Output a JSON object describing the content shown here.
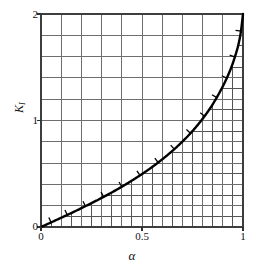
{
  "chart_data": {
    "type": "line",
    "title": "",
    "subtitle": "",
    "xlabel": "α",
    "ylabel": "K",
    "ylabel_subscript": "I",
    "xlim": [
      0,
      1
    ],
    "ylim": [
      0,
      2
    ],
    "grid": true,
    "grid_major_x_step": 0.1,
    "grid_major_y_step": 0.2,
    "grid_minor_divisions": 2,
    "legend": "none",
    "xticks": [
      0,
      0.5,
      1
    ],
    "xticklabels": [
      "0",
      "0.5",
      "1"
    ],
    "yticks": [
      0,
      1,
      2
    ],
    "yticklabels": [
      "0",
      "1",
      "2"
    ],
    "series": [
      {
        "name": "K_I",
        "style": "solid-thick-with-hatch-ticks",
        "color": "#000000",
        "x": [
          0.0,
          0.05,
          0.1,
          0.15,
          0.2,
          0.25,
          0.3,
          0.35,
          0.4,
          0.45,
          0.5,
          0.55,
          0.6,
          0.65,
          0.7,
          0.75,
          0.8,
          0.85,
          0.9,
          0.93,
          0.95,
          0.97,
          0.98,
          0.99,
          1.0
        ],
        "y": [
          0.0,
          0.043,
          0.087,
          0.131,
          0.177,
          0.224,
          0.273,
          0.324,
          0.378,
          0.436,
          0.497,
          0.563,
          0.635,
          0.714,
          0.802,
          0.901,
          1.016,
          1.152,
          1.32,
          1.442,
          1.54,
          1.66,
          1.735,
          1.84,
          2.0
        ]
      }
    ],
    "shaded_region": {
      "description": "dense cross-hatched mesh under the curve",
      "present": true
    },
    "hatch_tick_positions_alpha": [
      0.05,
      0.13,
      0.22,
      0.31,
      0.4,
      0.49,
      0.58,
      0.66,
      0.74,
      0.81,
      0.87,
      0.92,
      0.96,
      0.99
    ]
  },
  "colors": {
    "background": "#ffffff",
    "grid_major": "#6e6e6e",
    "grid_minor": "#555555",
    "curve": "#000000",
    "frame": "#3a3a3a",
    "text": "#111111"
  },
  "axes": {
    "x": {
      "title": "α",
      "ticks": [
        {
          "value": 0,
          "label": "0"
        },
        {
          "value": 0.5,
          "label": "0.5"
        },
        {
          "value": 1,
          "label": "1"
        }
      ]
    },
    "y": {
      "title": "K",
      "subscript": "I",
      "ticks": [
        {
          "value": 0,
          "label": "0"
        },
        {
          "value": 1,
          "label": "1"
        },
        {
          "value": 2,
          "label": "2"
        }
      ]
    }
  }
}
